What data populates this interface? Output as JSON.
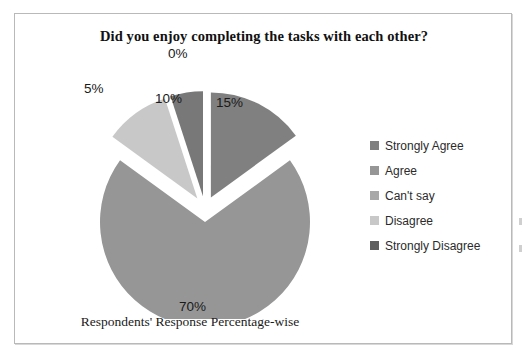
{
  "chart_data": {
    "type": "pie",
    "title": "Did you enjoy completing the tasks with each other?",
    "xlabel": "Respondents' Response Percentage-wise",
    "ylabel": "",
    "categories": [
      "Strongly Agree",
      "Agree",
      "Can't say",
      "Disagree",
      "Strongly Disagree"
    ],
    "values": [
      15,
      70,
      0,
      10,
      5
    ],
    "value_labels": [
      "15%",
      "70%",
      "0%",
      "10%",
      "5%"
    ],
    "colors": [
      "#808080",
      "#969696",
      "#a8a8a8",
      "#c8c8c8",
      "#787878"
    ],
    "exploded": true,
    "legend_position": "right",
    "grid": false,
    "units": "percent"
  },
  "chart": {
    "title": "Did you enjoy completing the tasks with each other?",
    "caption": "Respondents' Response Percentage-wise",
    "slices": [
      {
        "label": "Strongly Agree",
        "percent_label": "15%",
        "value": 15,
        "color": "#808080"
      },
      {
        "label": "Agree",
        "percent_label": "70%",
        "value": 70,
        "color": "#969696"
      },
      {
        "label": "Can't say",
        "percent_label": "0%",
        "value": 0,
        "color": "#a8a8a8"
      },
      {
        "label": "Disagree",
        "percent_label": "10%",
        "value": 10,
        "color": "#c8c8c8"
      },
      {
        "label": "Strongly Disagree",
        "percent_label": "5%",
        "value": 5,
        "color": "#787878"
      }
    ]
  },
  "legend": {
    "items": [
      {
        "label": "Strongly Agree",
        "color": "#808080"
      },
      {
        "label": "Agree",
        "color": "#969696"
      },
      {
        "label": "Can't say",
        "color": "#a8a8a8"
      },
      {
        "label": "Disagree",
        "color": "#c8c8c8"
      },
      {
        "label": "Strongly Disagree",
        "color": "#5e5e5e"
      }
    ]
  }
}
